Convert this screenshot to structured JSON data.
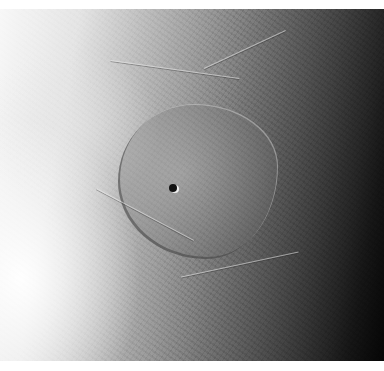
{
  "image": {
    "subject": "planetary-surface-grayscale",
    "description": "Grayscale photograph of an icy moon surface with a large smooth walled basin in the center, a small dark crater inside it, rough ridged terrain around it, lit from the left and fading to darkness on the right.",
    "colors": {
      "border": "#ffffff",
      "lit_side": "#f8f8f8",
      "mid": "#9a9a9a",
      "dark_side": "#050505",
      "crater": "#111111"
    }
  }
}
